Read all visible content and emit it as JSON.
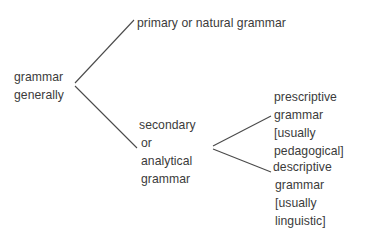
{
  "diagram": {
    "type": "tree-diagram",
    "style": {
      "background_color": "#ffffff",
      "text_color": "#3b3b3b",
      "line_color": "#4a4a4a"
    },
    "nodes": {
      "root": {
        "id": "grammar-generally",
        "lines": [
          "grammar",
          "generally"
        ]
      },
      "primary": {
        "id": "primary-or-natural-grammar",
        "lines": [
          "primary or natural grammar"
        ]
      },
      "secondary": {
        "id": "secondary-or-analytical-grammar",
        "lines": [
          "secondary",
          "or",
          "analytical",
          "grammar"
        ]
      },
      "prescriptive": {
        "id": "prescriptive-grammar",
        "lines": [
          "prescriptive",
          "grammar",
          "[usually",
          "pedagogical]"
        ]
      },
      "descriptive": {
        "id": "descriptive-grammar",
        "lines": [
          "descriptive",
          "grammar",
          "[usually",
          "linguistic]"
        ]
      }
    },
    "edges": [
      {
        "name": "root-to-primary",
        "from": "root",
        "to": "primary",
        "x1": 75,
        "y1": 83,
        "x2": 134,
        "y2": 20
      },
      {
        "name": "root-to-secondary",
        "from": "root",
        "to": "secondary",
        "x1": 75,
        "y1": 86,
        "x2": 137,
        "y2": 148
      },
      {
        "name": "secondary-to-prescriptive",
        "from": "secondary",
        "to": "prescriptive",
        "x1": 213,
        "y1": 146,
        "x2": 271,
        "y2": 116
      },
      {
        "name": "secondary-to-descriptive",
        "from": "secondary",
        "to": "descriptive",
        "x1": 213,
        "y1": 149,
        "x2": 271,
        "y2": 172
      }
    ]
  }
}
